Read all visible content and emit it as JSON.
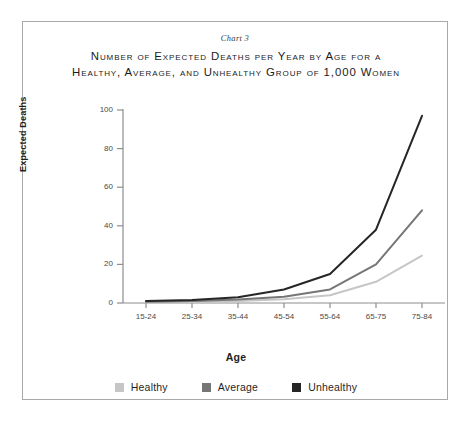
{
  "figure": {
    "caption": "Chart 3",
    "title_line_1": "Number of Expected Deaths per Year by Age for a",
    "title_line_2": "Healthy, Average, and Unhealthy Group of 1,000 Women",
    "border_color": "#a9a9a9"
  },
  "chart_data": {
    "type": "line",
    "title": "Number of Expected Deaths per Year by Age for a Healthy, Average, and Unhealthy Group of 1,000 Women",
    "subtitle": "Chart 3",
    "xlabel": "Age",
    "ylabel": "Expected Deaths",
    "categories": [
      "15-24",
      "25-34",
      "35-44",
      "45-54",
      "55-64",
      "65-75",
      "75-84"
    ],
    "ylim": [
      0,
      100
    ],
    "yticks": [
      0,
      20,
      40,
      60,
      80,
      100
    ],
    "ytick_labels": [
      "0",
      "20",
      "40",
      "60",
      "80",
      "100"
    ],
    "grid": false,
    "legend_position": "bottom",
    "series": [
      {
        "name": "Healthy",
        "color": "#c6c6c6",
        "values": [
          0.4,
          0.6,
          1.0,
          2.0,
          4.0,
          11.0,
          24.5
        ]
      },
      {
        "name": "Average",
        "color": "#767676",
        "values": [
          0.6,
          1.0,
          1.8,
          3.2,
          7.0,
          20.0,
          48.0
        ]
      },
      {
        "name": "Unhealthy",
        "color": "#262626",
        "values": [
          1.0,
          1.6,
          3.0,
          7.0,
          15.0,
          38.0,
          97.0
        ]
      }
    ]
  }
}
